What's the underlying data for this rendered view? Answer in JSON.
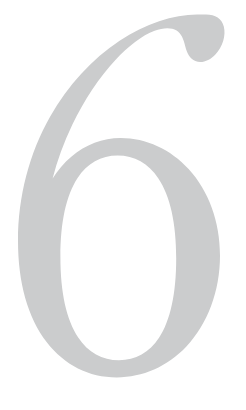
{
  "page": {
    "kind": "decorative-numeral",
    "background_color": "#ffffff",
    "width": 246,
    "height": 410
  },
  "numeral": {
    "character": "6",
    "name": "six",
    "fill_color": "#cbcccd",
    "style": "high-contrast-serif-didone",
    "terminal": "ball-terminal-top-right",
    "bounds": {
      "left": 10,
      "top": 14,
      "right": 228,
      "bottom": 376
    }
  }
}
